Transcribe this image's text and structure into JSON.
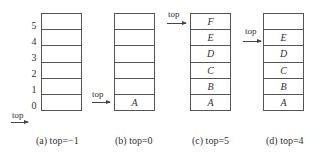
{
  "pointer_label": "top",
  "indices": [
    "5",
    "4",
    "3",
    "2",
    "1",
    "0"
  ],
  "stacks": [
    {
      "id": "a",
      "caption": "(a) top=−1",
      "top": -1,
      "cells_top_to_bottom": [
        "",
        "",
        "",
        "",
        "",
        ""
      ]
    },
    {
      "id": "b",
      "caption": "(b) top=0",
      "top": 0,
      "cells_top_to_bottom": [
        "",
        "",
        "",
        "",
        "",
        "A"
      ]
    },
    {
      "id": "c",
      "caption": "(c) top=5",
      "top": 5,
      "cells_top_to_bottom": [
        "F",
        "E",
        "D",
        "C",
        "B",
        "A"
      ]
    },
    {
      "id": "d",
      "caption": "(d) top=4",
      "top": 4,
      "cells_top_to_bottom": [
        "",
        "E",
        "D",
        "C",
        "B",
        "A"
      ]
    }
  ]
}
